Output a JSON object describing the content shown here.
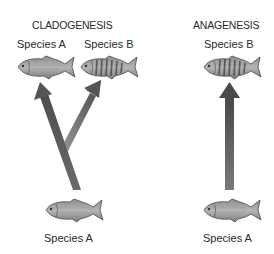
{
  "diagram": {
    "panels": [
      {
        "title": "CLADOGENESIS",
        "top_labels": [
          "Species A",
          "Species B"
        ],
        "bottom_label": "Species A",
        "description": "One ancestral species splits into two descendant species"
      },
      {
        "title": "ANAGENESIS",
        "top_labels": [
          "Species B"
        ],
        "bottom_label": "Species A",
        "description": "One species gradually transforms into a new species"
      }
    ],
    "colors": {
      "arrow_dark": "#5a5a5a",
      "arrow_light": "#8a8a8a",
      "fish_body": "#9a9a9a",
      "fish_outline": "#4a4a4a",
      "text": "#2a2a2a"
    },
    "icons": {
      "ancestral_fish": "plain-fish-icon",
      "descendant_fish": "striped-fish-icon",
      "arrow": "arrow-up-icon"
    }
  }
}
